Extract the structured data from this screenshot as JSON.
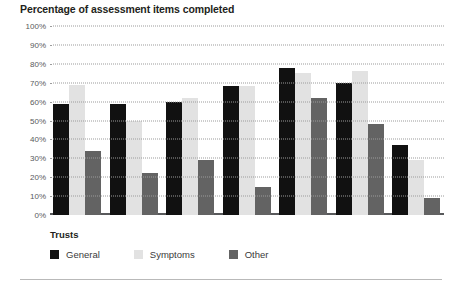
{
  "chart_data": {
    "type": "bar",
    "title": "Percentage of assessment items completed",
    "xlabel": "",
    "ylabel": "",
    "ylim": [
      0,
      100
    ],
    "ytick_labels": [
      "100%",
      "90%",
      "80%",
      "70%",
      "60%",
      "50%",
      "40%",
      "30%",
      "20%",
      "10%",
      "0%"
    ],
    "ytick_values": [
      100,
      90,
      80,
      70,
      60,
      50,
      40,
      30,
      20,
      10,
      0
    ],
    "grid": true,
    "grid_style": "dotted-horizontal",
    "legend_title": "Trusts",
    "legend_position": "bottom-left",
    "categories": [
      "1",
      "2",
      "3",
      "4",
      "5",
      "6",
      "7"
    ],
    "series": [
      {
        "name": "General",
        "color": "#111111",
        "values": [
          59,
          59,
          60,
          68,
          78,
          70,
          37
        ]
      },
      {
        "name": "Symptoms",
        "color": "#e2e2e2",
        "values": [
          69,
          50,
          62,
          68,
          75,
          76,
          29
        ]
      },
      {
        "name": "Other",
        "color": "#636363",
        "values": [
          34,
          22,
          29,
          15,
          62,
          48,
          9
        ]
      }
    ]
  },
  "legend": {
    "title": "Trusts",
    "items": [
      {
        "label": "General"
      },
      {
        "label": "Symptoms"
      },
      {
        "label": "Other"
      }
    ]
  }
}
